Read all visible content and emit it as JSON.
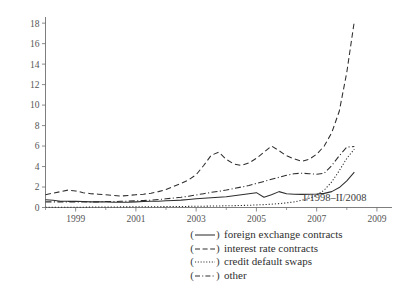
{
  "chart_data": {
    "type": "line",
    "title": "",
    "subtitle": "",
    "xlabel": "",
    "ylabel": "",
    "annotation": "I/1998–II/2008",
    "grid": false,
    "legend_position": "bottom-right",
    "xlim": [
      1998.0,
      2009.5
    ],
    "ylim": [
      0,
      18.6
    ],
    "yticks": [
      0,
      2,
      4,
      6,
      8,
      10,
      12,
      14,
      16,
      18
    ],
    "ytick_labels": [
      "0",
      "2",
      "4",
      "6",
      "8",
      "10",
      "12",
      "14",
      "16",
      "18"
    ],
    "xticks": [
      1999,
      2001,
      2003,
      2005,
      2007,
      2009
    ],
    "xtick_labels": [
      "1999",
      "2001",
      "2003",
      "2005",
      "2007",
      "2009"
    ],
    "x_minor_ticks": [
      1998,
      2000,
      2002,
      2004,
      2006,
      2008
    ],
    "x": [
      1998.0,
      1998.25,
      1998.5,
      1998.75,
      1999.0,
      1999.25,
      1999.5,
      1999.75,
      2000.0,
      2000.25,
      2000.5,
      2000.75,
      2001.0,
      2001.25,
      2001.5,
      2001.75,
      2002.0,
      2002.25,
      2002.5,
      2002.75,
      2003.0,
      2003.25,
      2003.5,
      2003.75,
      2004.0,
      2004.25,
      2004.5,
      2004.75,
      2005.0,
      2005.25,
      2005.5,
      2005.75,
      2006.0,
      2006.25,
      2006.5,
      2006.75,
      2007.0,
      2007.25,
      2007.5,
      2007.75,
      2008.0,
      2008.25
    ],
    "series": [
      {
        "name": "foreign exchange contracts",
        "line_style": "solid",
        "color": "#2e2e2e",
        "values": [
          0.75,
          0.7,
          0.62,
          0.6,
          0.6,
          0.58,
          0.55,
          0.55,
          0.55,
          0.52,
          0.52,
          0.52,
          0.55,
          0.58,
          0.6,
          0.62,
          0.65,
          0.68,
          0.72,
          0.78,
          0.85,
          0.9,
          0.95,
          1.0,
          1.05,
          1.15,
          1.25,
          1.35,
          1.45,
          1.0,
          1.25,
          1.55,
          1.35,
          1.3,
          1.28,
          1.3,
          1.32,
          1.38,
          1.55,
          1.95,
          2.6,
          3.45
        ]
      },
      {
        "name": "interest rate contracts",
        "line_style": "dashed",
        "color": "#2e2e2e",
        "values": [
          1.25,
          1.4,
          1.55,
          1.7,
          1.62,
          1.45,
          1.35,
          1.3,
          1.25,
          1.18,
          1.12,
          1.18,
          1.25,
          1.3,
          1.4,
          1.55,
          1.75,
          2.05,
          2.35,
          2.7,
          3.2,
          4.1,
          5.1,
          5.4,
          4.7,
          4.25,
          4.1,
          4.35,
          4.8,
          5.4,
          6.0,
          5.55,
          5.05,
          4.75,
          4.5,
          4.7,
          5.2,
          6.0,
          7.3,
          9.4,
          13.2,
          18.2
        ]
      },
      {
        "name": "credit default swaps",
        "line_style": "dotted",
        "color": "#2e2e2e",
        "values": [
          0.02,
          0.02,
          0.02,
          0.03,
          0.03,
          0.03,
          0.04,
          0.04,
          0.05,
          0.05,
          0.06,
          0.06,
          0.07,
          0.07,
          0.08,
          0.08,
          0.09,
          0.1,
          0.1,
          0.11,
          0.12,
          0.13,
          0.14,
          0.15,
          0.17,
          0.18,
          0.2,
          0.22,
          0.25,
          0.28,
          0.32,
          0.38,
          0.45,
          0.55,
          0.7,
          0.9,
          1.2,
          1.7,
          2.5,
          3.6,
          4.8,
          5.7
        ]
      },
      {
        "name": "other",
        "line_style": "dashdot",
        "color": "#2e2e2e",
        "values": [
          0.55,
          0.55,
          0.55,
          0.55,
          0.55,
          0.55,
          0.55,
          0.55,
          0.58,
          0.58,
          0.6,
          0.62,
          0.65,
          0.68,
          0.72,
          0.78,
          0.85,
          0.92,
          1.0,
          1.1,
          1.22,
          1.35,
          1.48,
          1.58,
          1.7,
          1.85,
          2.0,
          2.15,
          2.35,
          2.55,
          2.75,
          2.95,
          3.15,
          3.3,
          3.35,
          3.3,
          3.25,
          3.35,
          4.1,
          5.05,
          5.9,
          5.95
        ]
      }
    ],
    "legend_entries": [
      {
        "key": "(——)",
        "label": "foreign exchange contracts",
        "line_style": "solid"
      },
      {
        "key": "(– –)",
        "label": "interest rate contracts",
        "line_style": "dashed"
      },
      {
        "key": "(·····)",
        "label": "credit default swaps",
        "line_style": "dotted"
      },
      {
        "key": "(–·–)",
        "label": "other",
        "line_style": "dashdot"
      }
    ]
  }
}
